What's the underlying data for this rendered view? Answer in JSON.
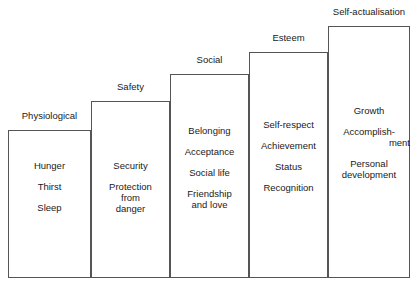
{
  "diagram": {
    "style": {
      "line_color": "#555555",
      "background": "#ffffff",
      "text_color": "#1a1a1a"
    },
    "tiers": [
      {
        "label": "Physiological",
        "items": [
          "Hunger",
          "Thirst",
          "Sleep"
        ]
      },
      {
        "label": "Safety",
        "items": [
          "Security",
          "Protection\nfrom\ndanger"
        ]
      },
      {
        "label": "Social",
        "items": [
          "Belonging",
          "Acceptance",
          "Social life",
          "Friendship\nand love"
        ]
      },
      {
        "label": "Esteem",
        "items": [
          "Self-respect",
          "Achievement",
          "Status",
          "Recognition"
        ]
      },
      {
        "label": "Self-actualisation",
        "items": [
          "Growth",
          "Accomplish-\nment",
          "Personal\ndevelopment"
        ]
      }
    ]
  }
}
